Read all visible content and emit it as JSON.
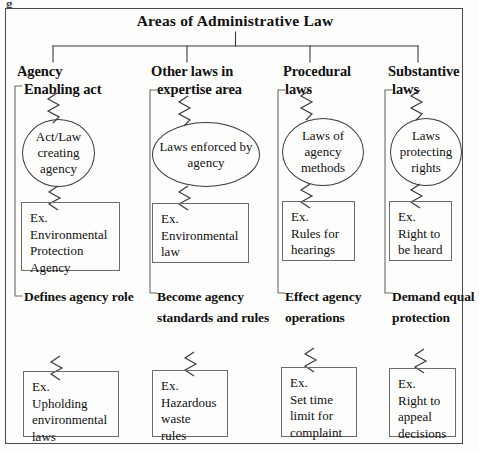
{
  "diagram": {
    "type": "hierarchy-tree",
    "title": "Areas of Administrative Law",
    "stray_mark": "g",
    "accent_line": "#3b3b3b",
    "box_border": "#6d6d6d",
    "background": "#fdfdfb",
    "branches": [
      {
        "id": "agency",
        "heading": "Agency",
        "top_label": "Enabling act",
        "node": "Act/Law creating agency",
        "node_shape": "circle",
        "top_example_lines": [
          "Ex.",
          "Environmental",
          "Protection",
          "Agency"
        ],
        "bottom_label_lines": [
          "Defines",
          "agency",
          "role"
        ],
        "bottom_example_lines": [
          "Ex.",
          "Upholding",
          "environmental",
          "laws"
        ]
      },
      {
        "id": "other-laws",
        "heading": "Other laws in",
        "top_label": "expertise area",
        "node": "Laws enforced by agency",
        "node_shape": "ellipse",
        "top_example_lines": [
          "Ex.",
          "Environmental",
          "law"
        ],
        "bottom_label_lines": [
          "Become agency",
          "standards and",
          "rules"
        ],
        "bottom_example_lines": [
          "Ex.",
          "Hazardous",
          "waste",
          "rules"
        ]
      },
      {
        "id": "procedural",
        "heading": "Procedural",
        "top_label": "laws",
        "node": "Laws of agency methods",
        "node_shape": "ellipse",
        "top_example_lines": [
          "Ex.",
          "Rules for",
          "hearings"
        ],
        "bottom_label_lines": [
          "Effect",
          "agency",
          "operations"
        ],
        "bottom_example_lines": [
          "Ex.",
          "Set time",
          "limit for",
          "complaint"
        ]
      },
      {
        "id": "substantive",
        "heading": "Substantive",
        "top_label": "laws",
        "node": "Laws protecting rights",
        "node_shape": "circle",
        "top_example_lines": [
          "Ex.",
          "Right to",
          "be heard"
        ],
        "bottom_label_lines": [
          "Demand",
          "equal",
          "protection"
        ],
        "bottom_example_lines": [
          "Ex.",
          "Right to",
          "appeal",
          "decisions"
        ]
      }
    ]
  }
}
